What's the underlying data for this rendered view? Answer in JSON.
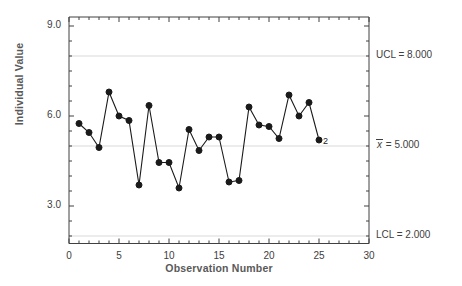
{
  "chart_data": {
    "type": "line",
    "title": "",
    "xlabel": "Observation Number",
    "ylabel": "Individual Value",
    "xlim": [
      0,
      30
    ],
    "ylim": [
      2.0,
      9.3
    ],
    "grid": false,
    "x": [
      1,
      2,
      3,
      4,
      5,
      6,
      7,
      8,
      9,
      10,
      11,
      12,
      13,
      14,
      15,
      16,
      17,
      18,
      19,
      20,
      21,
      22,
      23,
      24,
      25
    ],
    "values": [
      5.75,
      5.45,
      4.95,
      6.8,
      6.0,
      5.85,
      3.7,
      6.35,
      4.45,
      4.45,
      3.6,
      5.55,
      4.85,
      5.3,
      5.3,
      3.8,
      3.85,
      6.3,
      5.7,
      5.65,
      5.25,
      6.7,
      6.0,
      6.45,
      5.2
    ],
    "yticks": [
      3.0,
      6.0,
      9.0
    ],
    "ytick_labels": [
      "3.0",
      "6.0",
      "9.0"
    ],
    "xticks": [
      0,
      5,
      10,
      15,
      20,
      25,
      30
    ],
    "xtick_labels": [
      "0",
      "5",
      "10",
      "15",
      "20",
      "25",
      "30"
    ],
    "control_limits": [
      {
        "name": "UCL",
        "label": "UCL = 8.000",
        "value": 8.0,
        "color": "#d9d9d9"
      },
      {
        "name": "center",
        "label": "= 5.000",
        "prefix": "x",
        "value": 5.0,
        "color": "#d9d9d9"
      },
      {
        "name": "LCL",
        "label": "LCL = 2.000",
        "value": 2.0,
        "color": "#d9d9d9"
      }
    ],
    "annotations": [
      {
        "text": "2",
        "x": 25,
        "y": 5.2
      }
    ],
    "series_color": "#1a1a1a",
    "marker": "filled-circle"
  }
}
